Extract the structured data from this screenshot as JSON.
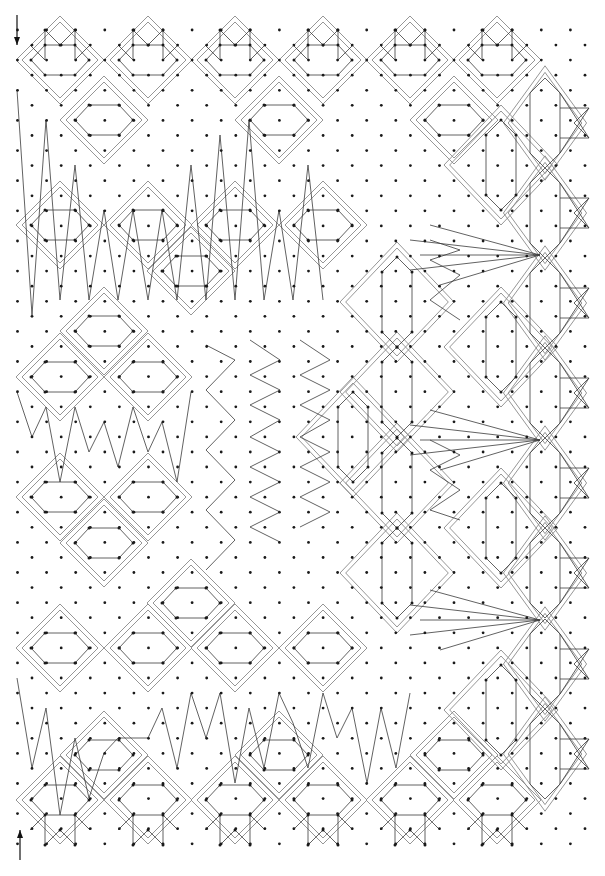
{
  "diagram": {
    "type": "bobbin-lace-pricking",
    "width": 605,
    "height": 876,
    "colors": {
      "dot": "#1a1a1a",
      "thread": "#3a3a3a",
      "frame": "#8a8a8a",
      "arrow": "#111111"
    },
    "grid": {
      "x0": 17.5,
      "dx": 14.55,
      "y0": 30,
      "dy": 15.07,
      "cols": 40,
      "rows": 55,
      "checkerboard": true
    },
    "arrows": [
      {
        "name": "start-arrow-icon",
        "x": 17,
        "y1": 15,
        "y2": 45,
        "direction": "down"
      },
      {
        "name": "end-arrow-icon",
        "x": 20,
        "y1": 860,
        "y2": 830,
        "direction": "up"
      }
    ],
    "horizontal_motifs": [
      {
        "x": 60,
        "y": 60
      },
      {
        "x": 148,
        "y": 60
      },
      {
        "x": 235,
        "y": 60
      },
      {
        "x": 323,
        "y": 60
      },
      {
        "x": 410,
        "y": 60
      },
      {
        "x": 497,
        "y": 60
      },
      {
        "x": 104,
        "y": 120
      },
      {
        "x": 279,
        "y": 120
      },
      {
        "x": 454,
        "y": 120
      },
      {
        "x": 60,
        "y": 225
      },
      {
        "x": 148,
        "y": 225
      },
      {
        "x": 235,
        "y": 225
      },
      {
        "x": 323,
        "y": 225
      },
      {
        "x": 191,
        "y": 271
      },
      {
        "x": 104,
        "y": 331
      },
      {
        "x": 60,
        "y": 377
      },
      {
        "x": 148,
        "y": 377
      },
      {
        "x": 60,
        "y": 497
      },
      {
        "x": 148,
        "y": 497
      },
      {
        "x": 104,
        "y": 543
      },
      {
        "x": 191,
        "y": 603
      },
      {
        "x": 60,
        "y": 648
      },
      {
        "x": 148,
        "y": 648
      },
      {
        "x": 235,
        "y": 648
      },
      {
        "x": 323,
        "y": 648
      },
      {
        "x": 104,
        "y": 755
      },
      {
        "x": 279,
        "y": 755
      },
      {
        "x": 454,
        "y": 755
      },
      {
        "x": 60,
        "y": 800
      },
      {
        "x": 148,
        "y": 800
      },
      {
        "x": 235,
        "y": 800
      },
      {
        "x": 323,
        "y": 800
      },
      {
        "x": 410,
        "y": 800
      },
      {
        "x": 497,
        "y": 800
      }
    ],
    "vertical_motifs": [
      {
        "x": 501,
        "y": 165
      },
      {
        "x": 397,
        "y": 302
      },
      {
        "x": 501,
        "y": 347
      },
      {
        "x": 397,
        "y": 392
      },
      {
        "x": 353,
        "y": 437
      },
      {
        "x": 397,
        "y": 483
      },
      {
        "x": 501,
        "y": 528
      },
      {
        "x": 397,
        "y": 573
      },
      {
        "x": 501,
        "y": 710
      }
    ],
    "edge_motifs": [
      {
        "x": 545,
        "y": 123
      },
      {
        "x": 545,
        "y": 213
      },
      {
        "x": 545,
        "y": 303
      },
      {
        "x": 545,
        "y": 393
      },
      {
        "x": 545,
        "y": 483
      },
      {
        "x": 545,
        "y": 573
      },
      {
        "x": 545,
        "y": 664
      },
      {
        "x": 545,
        "y": 754
      }
    ],
    "footside_top": [
      {
        "x": 60
      },
      {
        "x": 148
      },
      {
        "x": 235
      },
      {
        "x": 323
      },
      {
        "x": 410
      },
      {
        "x": 497
      }
    ],
    "zigzags": [
      [
        [
          17,
          90
        ],
        [
          32,
          315
        ],
        [
          46,
          120
        ],
        [
          60,
          300
        ],
        [
          75,
          165
        ],
        [
          89,
          300
        ],
        [
          104,
          210
        ],
        [
          118,
          300
        ],
        [
          133,
          210
        ],
        [
          148,
          300
        ],
        [
          162,
          210
        ],
        [
          177,
          300
        ],
        [
          191,
          165
        ],
        [
          206,
          300
        ],
        [
          220,
          135
        ],
        [
          235,
          300
        ],
        [
          249,
          120
        ],
        [
          264,
          300
        ],
        [
          279,
          210
        ],
        [
          293,
          300
        ],
        [
          308,
          165
        ],
        [
          323,
          300
        ]
      ],
      [
        [
          17,
          392
        ],
        [
          32,
          437
        ],
        [
          46,
          407
        ],
        [
          60,
          482
        ],
        [
          75,
          407
        ],
        [
          89,
          452
        ],
        [
          104,
          422
        ],
        [
          118,
          467
        ],
        [
          133,
          407
        ],
        [
          148,
          452
        ],
        [
          162,
          422
        ],
        [
          177,
          482
        ],
        [
          191,
          392
        ]
      ],
      [
        [
          17,
          678
        ],
        [
          32,
          768
        ],
        [
          46,
          708
        ],
        [
          60,
          815
        ],
        [
          75,
          738
        ],
        [
          89,
          798
        ],
        [
          104,
          753
        ],
        [
          118,
          738
        ],
        [
          148,
          738
        ],
        [
          162,
          708
        ],
        [
          177,
          768
        ],
        [
          191,
          693
        ],
        [
          206,
          738
        ],
        [
          220,
          693
        ],
        [
          235,
          783
        ],
        [
          249,
          708
        ],
        [
          264,
          768
        ],
        [
          279,
          693
        ],
        [
          293,
          723
        ],
        [
          308,
          768
        ],
        [
          323,
          693
        ],
        [
          337,
          738
        ],
        [
          352,
          708
        ],
        [
          367,
          783
        ],
        [
          381,
          708
        ],
        [
          396,
          768
        ],
        [
          410,
          693
        ]
      ],
      [
        [
          250,
          340
        ],
        [
          280,
          360
        ],
        [
          250,
          375
        ],
        [
          280,
          390
        ],
        [
          250,
          405
        ],
        [
          280,
          420
        ],
        [
          250,
          437
        ],
        [
          280,
          452
        ],
        [
          250,
          467
        ],
        [
          280,
          482
        ],
        [
          250,
          497
        ],
        [
          280,
          512
        ],
        [
          250,
          527
        ],
        [
          280,
          542
        ]
      ],
      [
        [
          300,
          340
        ],
        [
          330,
          360
        ],
        [
          300,
          375
        ],
        [
          330,
          390
        ],
        [
          300,
          405
        ],
        [
          330,
          420
        ],
        [
          300,
          437
        ],
        [
          330,
          452
        ],
        [
          300,
          467
        ],
        [
          330,
          482
        ],
        [
          300,
          497
        ],
        [
          330,
          512
        ],
        [
          300,
          527
        ]
      ],
      [
        [
          206,
          345
        ],
        [
          235,
          360
        ],
        [
          206,
          390
        ],
        [
          235,
          420
        ],
        [
          206,
          450
        ],
        [
          235,
          480
        ],
        [
          206,
          510
        ],
        [
          235,
          540
        ],
        [
          206,
          570
        ]
      ],
      [
        [
          430,
          240
        ],
        [
          460,
          250
        ],
        [
          430,
          260
        ],
        [
          460,
          275
        ],
        [
          430,
          300
        ],
        [
          460,
          320
        ]
      ],
      [
        [
          430,
          440
        ],
        [
          460,
          455
        ],
        [
          430,
          470
        ],
        [
          460,
          490
        ],
        [
          430,
          510
        ],
        [
          460,
          520
        ]
      ]
    ],
    "fans": [
      {
        "hub": [
          545,
          255
        ],
        "ends": [
          [
            410,
            240
          ],
          [
            420,
            255
          ],
          [
            410,
            270
          ],
          [
            440,
            285
          ],
          [
            430,
            225
          ]
        ]
      },
      {
        "hub": [
          545,
          440
        ],
        "ends": [
          [
            410,
            425
          ],
          [
            420,
            440
          ],
          [
            410,
            455
          ],
          [
            440,
            470
          ],
          [
            430,
            410
          ]
        ]
      },
      {
        "hub": [
          545,
          620
        ],
        "ends": [
          [
            410,
            605
          ],
          [
            420,
            620
          ],
          [
            410,
            635
          ],
          [
            440,
            650
          ],
          [
            430,
            590
          ]
        ]
      }
    ]
  }
}
